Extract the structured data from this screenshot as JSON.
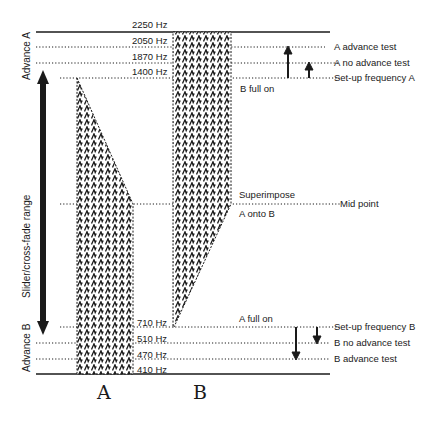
{
  "diagram": {
    "frequencies": {
      "f2250": "2250 Hz",
      "f2050": "2050 Hz",
      "f1870": "1870 Hz",
      "f1400": "1400 Hz",
      "f710": "710 Hz",
      "f510": "510 Hz",
      "f470": "470 Hz",
      "f410": "410 Hz"
    },
    "right_labels": {
      "a_advance_test": "A  advance test",
      "a_no_advance_test": "A  no advance test",
      "setup_freq_a": "Set-up frequency A",
      "mid_point": "Mid point",
      "setup_freq_b": "Set-up frequency B",
      "b_no_advance_test": "B  no advance test",
      "b_advance_test": "B  advance test"
    },
    "inner_labels": {
      "b_full_on": "B full on",
      "superimpose": "Superimpose",
      "a_onto_b": "A onto B",
      "a_full_on": "A full on"
    },
    "left_labels": {
      "advance_a": "Advance A",
      "slider_range": "Slider/cross-fade range",
      "advance_b": "Advance B"
    },
    "columns": {
      "a": "A",
      "b": "B"
    },
    "colors": {
      "ink": "#1a1a1a",
      "background": "#ffffff"
    }
  }
}
